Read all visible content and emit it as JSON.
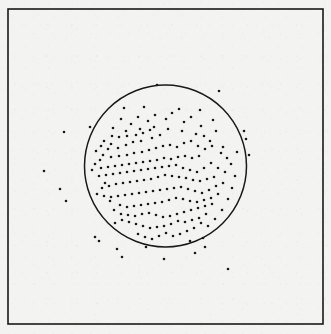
{
  "figure": {
    "kind": "scatter-plot-with-circle",
    "width": 331,
    "height": 334,
    "title": "",
    "subtitle": "",
    "background_color": "#f3f3f1",
    "ink_color": "#1a1a1a"
  },
  "frame": {
    "label": "plot-frame",
    "x": 8,
    "y": 9,
    "width": 315,
    "height": 315,
    "stroke_color": "#1a1a1a",
    "stroke_width": 1.6,
    "fill": "none"
  },
  "circle_overlay": {
    "label": "boundary-circle",
    "cx": 165.5,
    "cy": 166,
    "r": 81,
    "stroke_color": "#1a1a1a",
    "stroke_width": 1.5,
    "fill": "none"
  },
  "axes": {
    "xlabel": "",
    "ylabel": "",
    "xticks": [],
    "yticks": [],
    "xticklabels": [],
    "yticklabels": [],
    "grid": false,
    "legend": null
  },
  "chart_data": {
    "type": "scatter",
    "title": "",
    "xlabel": "",
    "ylabel": "",
    "xlim": [
      8,
      323
    ],
    "ylim": [
      9,
      324
    ],
    "grid": false,
    "legend_position": "none",
    "marker": {
      "shape": "circle",
      "color": "#1a1a1a",
      "size_px": 2.6
    },
    "annotations": [
      {
        "type": "circle",
        "cx": 165.5,
        "cy": 166,
        "r": 81,
        "description": "boundary circle enclosing the dense core of the point cloud"
      },
      {
        "type": "rect",
        "x": 8,
        "y": 9,
        "width": 315,
        "height": 315,
        "description": "outer rectangular plot frame"
      }
    ],
    "n_points": 207,
    "n_points_inside_circle": 178,
    "n_points_outside_circle": 29,
    "points": [
      [
        157,
        85
      ],
      [
        219,
        91
      ],
      [
        124,
        108
      ],
      [
        144,
        107
      ],
      [
        179,
        109
      ],
      [
        200,
        110
      ],
      [
        64,
        132
      ],
      [
        90,
        127
      ],
      [
        246,
        139
      ],
      [
        216,
        131
      ],
      [
        204,
        136
      ],
      [
        237,
        152
      ],
      [
        221,
        153
      ],
      [
        111,
        144
      ],
      [
        119,
        137
      ],
      [
        127,
        136
      ],
      [
        136,
        135
      ],
      [
        143,
        133
      ],
      [
        152,
        138
      ],
      [
        160,
        135
      ],
      [
        150,
        130
      ],
      [
        141,
        141
      ],
      [
        133,
        142
      ],
      [
        126,
        145
      ],
      [
        118,
        148
      ],
      [
        108,
        149
      ],
      [
        101,
        146
      ],
      [
        103,
        155
      ],
      [
        111,
        157
      ],
      [
        119,
        156
      ],
      [
        127,
        155
      ],
      [
        134,
        153
      ],
      [
        142,
        152
      ],
      [
        149,
        150
      ],
      [
        156,
        148
      ],
      [
        163,
        146
      ],
      [
        170,
        145
      ],
      [
        177,
        147
      ],
      [
        184,
        143
      ],
      [
        191,
        141
      ],
      [
        198,
        146
      ],
      [
        205,
        149
      ],
      [
        212,
        146
      ],
      [
        199,
        156
      ],
      [
        192,
        158
      ],
      [
        185,
        156
      ],
      [
        178,
        157
      ],
      [
        171,
        159
      ],
      [
        164,
        158
      ],
      [
        157,
        160
      ],
      [
        150,
        161
      ],
      [
        143,
        162
      ],
      [
        136,
        163
      ],
      [
        129,
        164
      ],
      [
        122,
        165
      ],
      [
        115,
        166
      ],
      [
        108,
        167
      ],
      [
        101,
        168
      ],
      [
        95,
        164
      ],
      [
        92,
        170
      ],
      [
        99,
        176
      ],
      [
        106,
        175
      ],
      [
        113,
        174
      ],
      [
        120,
        173
      ],
      [
        127,
        172
      ],
      [
        134,
        171
      ],
      [
        141,
        170
      ],
      [
        148,
        169
      ],
      [
        155,
        168
      ],
      [
        162,
        167
      ],
      [
        169,
        166
      ],
      [
        176,
        165
      ],
      [
        183,
        168
      ],
      [
        190,
        170
      ],
      [
        197,
        172
      ],
      [
        204,
        168
      ],
      [
        211,
        163
      ],
      [
        218,
        168
      ],
      [
        225,
        172
      ],
      [
        214,
        177
      ],
      [
        207,
        179
      ],
      [
        200,
        181
      ],
      [
        193,
        180
      ],
      [
        186,
        178
      ],
      [
        179,
        177
      ],
      [
        172,
        176
      ],
      [
        165,
        175
      ],
      [
        158,
        177
      ],
      [
        151,
        179
      ],
      [
        144,
        180
      ],
      [
        137,
        181
      ],
      [
        130,
        182
      ],
      [
        123,
        183
      ],
      [
        116,
        184
      ],
      [
        109,
        186
      ],
      [
        102,
        188
      ],
      [
        97,
        194
      ],
      [
        104,
        196
      ],
      [
        111,
        197
      ],
      [
        118,
        196
      ],
      [
        125,
        195
      ],
      [
        132,
        194
      ],
      [
        139,
        193
      ],
      [
        146,
        192
      ],
      [
        153,
        191
      ],
      [
        160,
        190
      ],
      [
        167,
        189
      ],
      [
        174,
        188
      ],
      [
        181,
        187
      ],
      [
        188,
        189
      ],
      [
        195,
        191
      ],
      [
        202,
        193
      ],
      [
        209,
        190
      ],
      [
        216,
        186
      ],
      [
        223,
        183
      ],
      [
        218,
        194
      ],
      [
        211,
        198
      ],
      [
        204,
        200
      ],
      [
        197,
        202
      ],
      [
        190,
        201
      ],
      [
        183,
        199
      ],
      [
        176,
        198
      ],
      [
        169,
        200
      ],
      [
        162,
        202
      ],
      [
        155,
        203
      ],
      [
        148,
        204
      ],
      [
        141,
        205
      ],
      [
        134,
        206
      ],
      [
        127,
        207
      ],
      [
        120,
        205
      ],
      [
        114,
        210
      ],
      [
        121,
        214
      ],
      [
        128,
        215
      ],
      [
        135,
        216
      ],
      [
        142,
        214
      ],
      [
        149,
        213
      ],
      [
        156,
        215
      ],
      [
        163,
        217
      ],
      [
        170,
        216
      ],
      [
        177,
        214
      ],
      [
        184,
        212
      ],
      [
        191,
        210
      ],
      [
        198,
        208
      ],
      [
        205,
        206
      ],
      [
        212,
        204
      ],
      [
        206,
        214
      ],
      [
        199,
        218
      ],
      [
        192,
        220
      ],
      [
        185,
        222
      ],
      [
        178,
        221
      ],
      [
        171,
        224
      ],
      [
        164,
        226
      ],
      [
        157,
        227
      ],
      [
        150,
        228
      ],
      [
        143,
        226
      ],
      [
        136,
        224
      ],
      [
        129,
        222
      ],
      [
        122,
        220
      ],
      [
        115,
        223
      ],
      [
        110,
        201
      ],
      [
        105,
        183
      ],
      [
        100,
        160
      ],
      [
        96,
        151
      ],
      [
        113,
        128
      ],
      [
        131,
        124
      ],
      [
        148,
        121
      ],
      [
        166,
        119
      ],
      [
        184,
        122
      ],
      [
        201,
        126
      ],
      [
        213,
        120
      ],
      [
        172,
        113
      ],
      [
        191,
        117
      ],
      [
        155,
        115
      ],
      [
        138,
        117
      ],
      [
        121,
        119
      ],
      [
        166,
        233
      ],
      [
        173,
        236
      ],
      [
        180,
        234
      ],
      [
        187,
        231
      ],
      [
        194,
        228
      ],
      [
        159,
        236
      ],
      [
        152,
        239
      ],
      [
        145,
        237
      ],
      [
        138,
        234
      ],
      [
        201,
        223
      ],
      [
        208,
        226
      ],
      [
        215,
        219
      ],
      [
        222,
        210
      ],
      [
        228,
        199
      ],
      [
        232,
        188
      ],
      [
        235,
        176
      ],
      [
        231,
        164
      ],
      [
        227,
        158
      ],
      [
        223,
        147
      ],
      [
        210,
        141
      ],
      [
        196,
        134
      ],
      [
        182,
        131
      ],
      [
        168,
        129
      ],
      [
        154,
        127
      ],
      [
        140,
        129
      ],
      [
        126,
        131
      ],
      [
        112,
        136
      ],
      [
        104,
        141
      ],
      [
        117,
        249
      ],
      [
        146,
        247
      ],
      [
        190,
        241
      ],
      [
        203,
        238
      ],
      [
        44,
        171
      ],
      [
        60,
        189
      ],
      [
        66,
        201
      ],
      [
        99,
        241
      ],
      [
        122,
        257
      ],
      [
        164,
        259
      ],
      [
        195,
        253
      ],
      [
        228,
        269
      ],
      [
        244,
        131
      ],
      [
        205,
        247
      ],
      [
        95,
        237
      ],
      [
        249,
        155
      ]
    ]
  }
}
